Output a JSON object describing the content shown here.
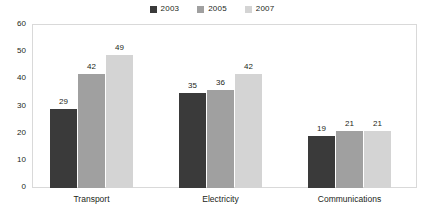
{
  "chart_data": {
    "type": "bar",
    "title": "",
    "subtitle": "",
    "xlabel": "",
    "ylabel": "",
    "categories": [
      "Transport",
      "Electricity",
      "Communications"
    ],
    "series": [
      {
        "name": "2003",
        "color": "#3a3a3a",
        "values": [
          29,
          35,
          19
        ]
      },
      {
        "name": "2005",
        "color": "#a0a0a0",
        "values": [
          42,
          36,
          21
        ]
      },
      {
        "name": "2007",
        "color": "#d4d4d4",
        "values": [
          49,
          42,
          21
        ]
      }
    ],
    "ylim": [
      0,
      60
    ],
    "yticks": [
      0,
      10,
      20,
      30,
      40,
      50,
      60
    ],
    "ytick_labels": [
      "0",
      "10",
      "20",
      "30",
      "40",
      "50",
      "60"
    ],
    "grid": false,
    "legend_position": "top-center",
    "data_labels": true,
    "annotations": []
  },
  "legend": {
    "items": [
      {
        "label": "2003",
        "color": "#3a3a3a"
      },
      {
        "label": "2005",
        "color": "#a0a0a0"
      },
      {
        "label": "2007",
        "color": "#d4d4d4"
      }
    ]
  },
  "axis": {
    "y_labels": [
      "60",
      "50",
      "40",
      "30",
      "20",
      "10",
      "0"
    ],
    "x_labels": [
      "Transport",
      "Electricity",
      "Communications"
    ]
  },
  "values": {
    "transport": {
      "y2003": "29",
      "y2005": "42",
      "y2007": "49"
    },
    "electricity": {
      "y2003": "35",
      "y2005": "36",
      "y2007": "42"
    },
    "communications": {
      "y2003": "19",
      "y2005": "21",
      "y2007": "21"
    }
  },
  "style": {
    "plot_border": "#d9d9d9",
    "text_color": "#231f20",
    "background": "#ffffff"
  }
}
